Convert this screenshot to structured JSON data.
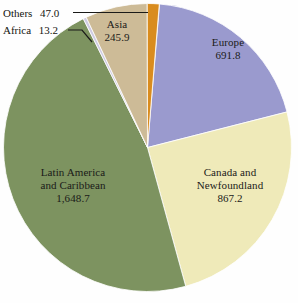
{
  "chart_data": {
    "type": "pie",
    "title": "",
    "subtitle": "",
    "unit": "",
    "total": 3513.8,
    "legend": "none",
    "labels_inside": true,
    "start_angle_deg": 0,
    "direction": "clockwise",
    "categories": [
      "Europe",
      "Canada and Newfoundland",
      "Latin America and Caribbean",
      "Africa",
      "Asia",
      "Others"
    ],
    "values": [
      691.8,
      867.2,
      1648.7,
      13.2,
      245.9,
      47.0
    ],
    "value_labels": [
      "691.8",
      "867.2",
      "1,648.7",
      "13.2",
      "245.9",
      "47.0"
    ],
    "colors": [
      "#9a9ace",
      "#efeab9",
      "#7d9360",
      "#cfcbe2",
      "#cdbb97",
      "#d98c1e"
    ],
    "slices": [
      {
        "name": "Europe",
        "name_line1": "Europe",
        "name_line2": "",
        "value": 691.8,
        "value_label": "691.8",
        "color": "#9a9ace",
        "label_placement": "inside",
        "start_deg": 4.8,
        "end_deg": 75.7
      },
      {
        "name": "Canada and Newfoundland",
        "name_line1": "Canada and",
        "name_line2": "Newfoundland",
        "value": 867.2,
        "value_label": "867.2",
        "color": "#efeab9",
        "label_placement": "inside",
        "start_deg": 75.7,
        "end_deg": 164.6
      },
      {
        "name": "Latin America and Caribbean",
        "name_line1": "Latin America",
        "name_line2": "and Caribbean",
        "value": 1648.7,
        "value_label": "1,648.7",
        "color": "#7d9360",
        "label_placement": "inside",
        "start_deg": 164.6,
        "end_deg": 333.5
      },
      {
        "name": "Africa",
        "name_line1": "Africa",
        "name_line2": "",
        "value": 13.2,
        "value_label": "13.2",
        "color": "#cfcbe2",
        "label_placement": "callout",
        "start_deg": 333.5,
        "end_deg": 334.8
      },
      {
        "name": "Asia",
        "name_line1": "Asia",
        "name_line2": "",
        "value": 245.9,
        "value_label": "245.9",
        "color": "#cdbb97",
        "label_placement": "inside",
        "start_deg": 334.8,
        "end_deg": 359.9
      },
      {
        "name": "Others",
        "name_line1": "Others",
        "name_line2": "",
        "value": 47.0,
        "value_label": "47.0",
        "color": "#d98c1e",
        "label_placement": "callout",
        "start_deg": 359.9,
        "end_deg": 364.7
      }
    ]
  }
}
